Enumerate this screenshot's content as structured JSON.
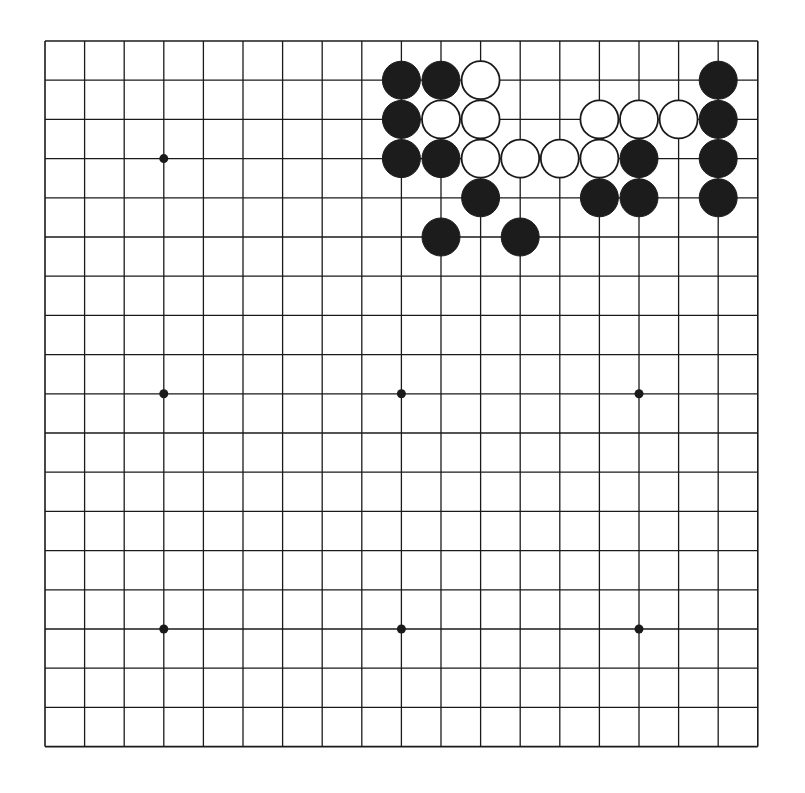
{
  "board": {
    "size": 19,
    "origin_x": 45,
    "origin_y": 41,
    "spacing_x": 39.6,
    "spacing_y": 39.2,
    "line_color": "#1a1a1a",
    "background": "#ffffff",
    "star_points": [
      [
        3,
        3
      ],
      [
        9,
        3
      ],
      [
        15,
        3
      ],
      [
        3,
        9
      ],
      [
        9,
        9
      ],
      [
        15,
        9
      ],
      [
        3,
        15
      ],
      [
        9,
        15
      ],
      [
        15,
        15
      ]
    ],
    "hidden_star_points": [
      [
        9,
        3
      ],
      [
        15,
        3
      ]
    ]
  },
  "stones": [
    {
      "color": "black",
      "col": 9,
      "row": 1
    },
    {
      "color": "black",
      "col": 10,
      "row": 1
    },
    {
      "color": "white",
      "col": 11,
      "row": 1
    },
    {
      "color": "black",
      "col": 17,
      "row": 1
    },
    {
      "color": "black",
      "col": 9,
      "row": 2
    },
    {
      "color": "white",
      "col": 10,
      "row": 2
    },
    {
      "color": "white",
      "col": 11,
      "row": 2
    },
    {
      "color": "white",
      "col": 14,
      "row": 2
    },
    {
      "color": "white",
      "col": 15,
      "row": 2
    },
    {
      "color": "white",
      "col": 16,
      "row": 2
    },
    {
      "color": "black",
      "col": 17,
      "row": 2
    },
    {
      "color": "black",
      "col": 9,
      "row": 3
    },
    {
      "color": "black",
      "col": 10,
      "row": 3
    },
    {
      "color": "white",
      "col": 11,
      "row": 3
    },
    {
      "color": "white",
      "col": 12,
      "row": 3
    },
    {
      "color": "white",
      "col": 13,
      "row": 3
    },
    {
      "color": "white",
      "col": 14,
      "row": 3
    },
    {
      "color": "black",
      "col": 15,
      "row": 3
    },
    {
      "color": "black",
      "col": 17,
      "row": 3
    },
    {
      "color": "black",
      "col": 11,
      "row": 4
    },
    {
      "color": "black",
      "col": 14,
      "row": 4
    },
    {
      "color": "black",
      "col": 15,
      "row": 4
    },
    {
      "color": "black",
      "col": 17,
      "row": 4
    },
    {
      "color": "black",
      "col": 10,
      "row": 5
    },
    {
      "color": "black",
      "col": 12,
      "row": 5
    }
  ],
  "colors": {
    "black_stone": "#1c1c1c",
    "white_stone": "#ffffff",
    "white_stone_border": "#1a1a1a"
  }
}
